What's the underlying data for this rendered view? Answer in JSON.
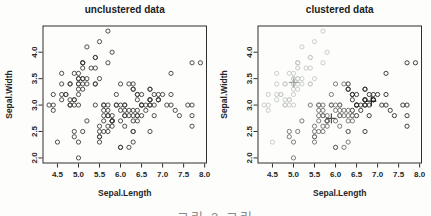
{
  "caption": "그림 3 그림",
  "chart_data": {
    "type": "scatter",
    "xlabel": "Sepal.Length",
    "ylabel": "Sepal.Width",
    "xlim": [
      4.156,
      8.044
    ],
    "ylim": [
      1.904,
      4.496
    ],
    "xticks": [
      4.5,
      5.0,
      5.5,
      6.0,
      6.5,
      7.0,
      7.5,
      8.0
    ],
    "yticks": [
      2.0,
      2.5,
      3.0,
      3.5,
      4.0
    ],
    "grid": false,
    "axis_color": "#2f2f2f",
    "points": [
      [
        5.1,
        3.5,
        1
      ],
      [
        4.9,
        3.0,
        1
      ],
      [
        4.7,
        3.2,
        1
      ],
      [
        4.6,
        3.1,
        1
      ],
      [
        5.0,
        3.6,
        1
      ],
      [
        5.4,
        3.9,
        1
      ],
      [
        4.6,
        3.4,
        1
      ],
      [
        5.0,
        3.4,
        1
      ],
      [
        4.4,
        2.9,
        1
      ],
      [
        4.9,
        3.1,
        1
      ],
      [
        5.4,
        3.7,
        1
      ],
      [
        4.8,
        3.4,
        1
      ],
      [
        4.8,
        3.0,
        1
      ],
      [
        4.3,
        3.0,
        1
      ],
      [
        5.8,
        4.0,
        1
      ],
      [
        5.7,
        4.4,
        1
      ],
      [
        5.4,
        3.9,
        1
      ],
      [
        5.1,
        3.5,
        1
      ],
      [
        5.7,
        3.8,
        1
      ],
      [
        5.1,
        3.8,
        1
      ],
      [
        5.4,
        3.4,
        1
      ],
      [
        5.1,
        3.7,
        1
      ],
      [
        4.6,
        3.6,
        1
      ],
      [
        5.1,
        3.3,
        1
      ],
      [
        4.8,
        3.4,
        1
      ],
      [
        5.0,
        3.0,
        1
      ],
      [
        5.0,
        3.4,
        1
      ],
      [
        5.2,
        3.5,
        1
      ],
      [
        5.2,
        3.4,
        1
      ],
      [
        4.7,
        3.2,
        1
      ],
      [
        4.8,
        3.1,
        1
      ],
      [
        5.4,
        3.4,
        1
      ],
      [
        5.2,
        4.1,
        1
      ],
      [
        5.5,
        4.2,
        1
      ],
      [
        4.9,
        3.1,
        1
      ],
      [
        5.0,
        3.2,
        1
      ],
      [
        5.5,
        3.5,
        1
      ],
      [
        4.9,
        3.6,
        1
      ],
      [
        4.4,
        3.0,
        1
      ],
      [
        5.1,
        3.4,
        1
      ],
      [
        5.0,
        3.5,
        1
      ],
      [
        4.5,
        2.3,
        1
      ],
      [
        4.4,
        3.2,
        1
      ],
      [
        5.0,
        3.5,
        1
      ],
      [
        5.1,
        3.8,
        1
      ],
      [
        4.8,
        3.0,
        1
      ],
      [
        5.1,
        3.8,
        1
      ],
      [
        4.6,
        3.2,
        1
      ],
      [
        5.3,
        3.7,
        1
      ],
      [
        5.0,
        3.3,
        1
      ],
      [
        7.0,
        3.2,
        3
      ],
      [
        6.4,
        3.2,
        3
      ],
      [
        6.9,
        3.1,
        3
      ],
      [
        5.5,
        2.3,
        2
      ],
      [
        6.5,
        2.8,
        3
      ],
      [
        5.7,
        2.8,
        2
      ],
      [
        6.3,
        3.3,
        3
      ],
      [
        4.9,
        2.4,
        2
      ],
      [
        6.6,
        2.9,
        3
      ],
      [
        5.2,
        2.7,
        2
      ],
      [
        5.0,
        2.0,
        2
      ],
      [
        5.9,
        3.0,
        2
      ],
      [
        6.0,
        2.2,
        2
      ],
      [
        6.1,
        2.9,
        2
      ],
      [
        5.6,
        2.9,
        2
      ],
      [
        6.7,
        3.1,
        3
      ],
      [
        5.6,
        3.0,
        2
      ],
      [
        5.8,
        2.7,
        2
      ],
      [
        6.2,
        2.2,
        2
      ],
      [
        5.6,
        2.5,
        2
      ],
      [
        5.9,
        3.2,
        2
      ],
      [
        6.1,
        2.8,
        2
      ],
      [
        6.3,
        2.5,
        2
      ],
      [
        6.1,
        2.8,
        2
      ],
      [
        6.4,
        2.9,
        3
      ],
      [
        6.6,
        3.0,
        3
      ],
      [
        6.8,
        2.8,
        3
      ],
      [
        6.7,
        3.0,
        3
      ],
      [
        6.0,
        2.9,
        2
      ],
      [
        5.7,
        2.6,
        2
      ],
      [
        5.5,
        2.4,
        2
      ],
      [
        5.5,
        2.4,
        2
      ],
      [
        5.8,
        2.7,
        2
      ],
      [
        6.0,
        2.7,
        2
      ],
      [
        5.4,
        3.0,
        2
      ],
      [
        6.0,
        3.4,
        2
      ],
      [
        6.7,
        3.1,
        3
      ],
      [
        6.3,
        2.3,
        2
      ],
      [
        5.6,
        3.0,
        2
      ],
      [
        5.5,
        2.5,
        2
      ],
      [
        5.5,
        2.6,
        2
      ],
      [
        6.1,
        3.0,
        2
      ],
      [
        5.8,
        2.6,
        2
      ],
      [
        5.0,
        2.3,
        2
      ],
      [
        5.6,
        2.7,
        2
      ],
      [
        5.7,
        3.0,
        2
      ],
      [
        5.7,
        2.9,
        2
      ],
      [
        6.2,
        2.9,
        2
      ],
      [
        5.1,
        2.5,
        2
      ],
      [
        5.7,
        2.8,
        2
      ],
      [
        6.3,
        3.3,
        3
      ],
      [
        5.8,
        2.7,
        2
      ],
      [
        7.1,
        3.0,
        3
      ],
      [
        6.3,
        2.9,
        2
      ],
      [
        6.5,
        3.0,
        3
      ],
      [
        7.6,
        3.0,
        3
      ],
      [
        4.9,
        2.5,
        2
      ],
      [
        7.3,
        2.9,
        3
      ],
      [
        6.7,
        2.5,
        3
      ],
      [
        7.2,
        3.6,
        3
      ],
      [
        6.5,
        3.2,
        3
      ],
      [
        6.4,
        2.7,
        2
      ],
      [
        6.8,
        3.0,
        3
      ],
      [
        5.7,
        2.5,
        2
      ],
      [
        5.8,
        2.8,
        2
      ],
      [
        6.4,
        3.2,
        3
      ],
      [
        6.5,
        3.0,
        3
      ],
      [
        7.7,
        3.8,
        3
      ],
      [
        7.7,
        2.6,
        3
      ],
      [
        6.0,
        2.2,
        2
      ],
      [
        6.9,
        3.2,
        3
      ],
      [
        5.6,
        2.8,
        2
      ],
      [
        7.7,
        2.8,
        3
      ],
      [
        6.3,
        2.7,
        2
      ],
      [
        6.7,
        3.3,
        3
      ],
      [
        7.2,
        3.2,
        3
      ],
      [
        6.2,
        2.8,
        2
      ],
      [
        6.1,
        3.0,
        2
      ],
      [
        6.4,
        2.8,
        2
      ],
      [
        7.2,
        3.0,
        3
      ],
      [
        7.4,
        2.8,
        3
      ],
      [
        7.9,
        3.8,
        3
      ],
      [
        6.4,
        2.8,
        2
      ],
      [
        6.3,
        2.8,
        2
      ],
      [
        6.1,
        2.6,
        2
      ],
      [
        7.7,
        3.0,
        3
      ],
      [
        6.3,
        3.4,
        3
      ],
      [
        6.4,
        3.1,
        3
      ],
      [
        6.0,
        3.0,
        2
      ],
      [
        6.9,
        3.1,
        3
      ],
      [
        6.7,
        3.1,
        3
      ],
      [
        6.9,
        3.1,
        3
      ],
      [
        5.8,
        2.7,
        2
      ],
      [
        6.8,
        3.2,
        3
      ],
      [
        6.7,
        3.3,
        3
      ],
      [
        6.7,
        3.0,
        3
      ],
      [
        6.3,
        2.5,
        2
      ],
      [
        6.5,
        3.0,
        3
      ],
      [
        6.2,
        3.4,
        2
      ],
      [
        5.9,
        3.0,
        2
      ]
    ],
    "panels": [
      {
        "title": "unclustered data",
        "mode": "uniform",
        "point_color": "#3d3d3d"
      },
      {
        "title": "clustered data",
        "mode": "by_cluster",
        "cluster_colors": [
          "#c3c8c3",
          "#6e6e6e",
          "#2e2e2e"
        ],
        "centers": [
          [
            5.006,
            3.428
          ],
          [
            5.902,
            2.748
          ],
          [
            6.85,
            3.074
          ]
        ],
        "center_colors": [
          "#9aa09a",
          "#4d4d4d",
          "#1f1f1f"
        ]
      }
    ]
  }
}
